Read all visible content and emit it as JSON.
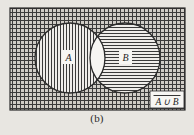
{
  "figure": {
    "caption": "(b)",
    "type": "venn-diagram",
    "universe_label": "",
    "sets": [
      {
        "id": "A",
        "label": "A",
        "fill": "vertical-hatch",
        "cx": 70,
        "cy": 58,
        "r": 35
      },
      {
        "id": "B",
        "label": "B",
        "fill": "horizontal-hatch",
        "cx": 125,
        "cy": 58,
        "r": 35
      }
    ],
    "region_label": {
      "text": "A ∪ B",
      "overline": true,
      "meaning": "complement-of-A-union-B"
    },
    "rect": {
      "x": 10,
      "y": 8,
      "width": 175,
      "height": 102,
      "fill": "cross-hatch-grid"
    },
    "intersection_fill": "white",
    "colors": {
      "paper": "#e8e6e1",
      "ink": "#2b2b2b",
      "hatch": "#3a3a3a",
      "box": "#ffffff"
    }
  }
}
